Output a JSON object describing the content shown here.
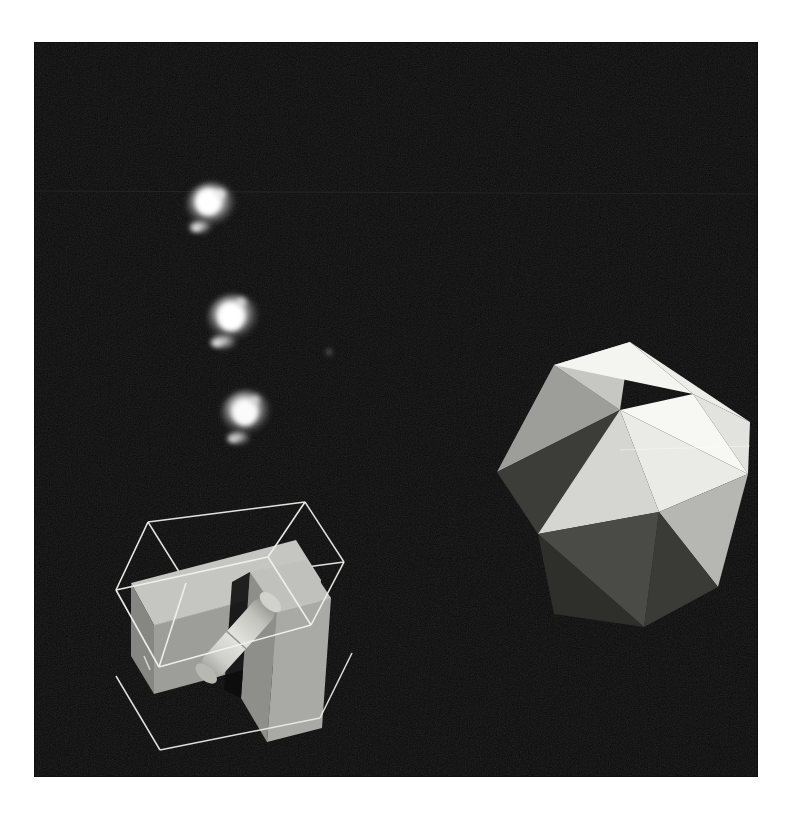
{
  "scene": {
    "title": "Raytraced CGI test scene",
    "background_color": "#050505",
    "canvas": {
      "width": 792,
      "height": 816
    },
    "frame": {
      "x": 34,
      "y": 42,
      "width": 724,
      "height": 735,
      "border_color": "#ffffff"
    },
    "page_background": "#ffffff",
    "seam_line": {
      "y": 191,
      "color": "#1d1d1d",
      "label": "scanline-seam"
    }
  },
  "objects": {
    "wireframe_cube": {
      "label": "wireframe-cube",
      "stroke_color": "#e8e8e4",
      "stroke_width": 1.6,
      "front_face": [
        [
          115,
          590
        ],
        [
          235,
          557
        ],
        [
          278,
          628
        ],
        [
          155,
          672
        ]
      ],
      "back_face": [
        [
          148,
          522
        ],
        [
          266,
          497
        ],
        [
          304,
          562
        ],
        [
          188,
          590
        ]
      ],
      "center": [
        210,
        598
      ]
    },
    "box_large": {
      "label": "gray-box-large",
      "top_color": "#c9c9c5",
      "left_color": "#8e8e8a",
      "front_color": "#a3a39f",
      "center": [
        172,
        586
      ]
    },
    "box_slab": {
      "label": "gray-box-slab",
      "top_color": "#c4c4c0",
      "side_color": "#9b9b97",
      "front_color": "#b0b0ac",
      "center": [
        248,
        608
      ]
    },
    "cylinder": {
      "label": "gray-cylinder-rod",
      "body_color": "#d7d7d2",
      "shade_color": "#b5b5b0",
      "cap_color": "#c0c0bb",
      "angle_degrees": 52,
      "start": [
        196,
        682
      ],
      "end": [
        262,
        607
      ]
    },
    "icosahedron": {
      "label": "icosahedron",
      "center": [
        620,
        472
      ],
      "radius": 134,
      "facet_colors": [
        "#f2f2ee",
        "#e7e7e3",
        "#dcdcd8",
        "#cfcfcb",
        "#bfbfbb",
        "#ababa7",
        "#9a9a96",
        "#868682",
        "#6e6e6a",
        "#565652",
        "#464642",
        "#3a3a36",
        "#2c2c29"
      ]
    },
    "particle_clusters": [
      {
        "label": "particle-cluster-1",
        "x": 211,
        "y": 205,
        "size": 26,
        "brightness": "#fdfdfd"
      },
      {
        "label": "particle-cluster-2",
        "x": 233,
        "y": 317,
        "size": 28,
        "brightness": "#fbfbfb"
      },
      {
        "label": "particle-cluster-3",
        "x": 246,
        "y": 412,
        "size": 26,
        "brightness": "#f7f7f7"
      }
    ],
    "lone_particle": {
      "label": "lone-particle-dot",
      "x": 329,
      "y": 352,
      "size": 5,
      "brightness": "#8d8d8d"
    }
  }
}
